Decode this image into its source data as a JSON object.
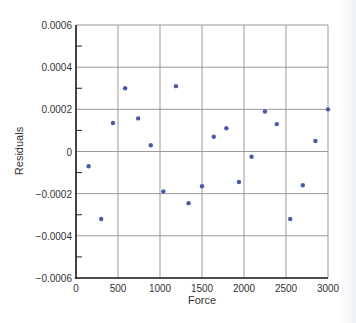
{
  "chart_data": {
    "type": "scatter",
    "title": "",
    "xlabel": "Force",
    "ylabel": "Residuals",
    "xlim": [
      0,
      3000
    ],
    "ylim": [
      -0.0006,
      0.0006
    ],
    "xticks": [
      "0",
      "500",
      "1000",
      "1500",
      "2000",
      "2500",
      "3000"
    ],
    "yticks": [
      "0.0006",
      "0.0004",
      "0.0002",
      "0",
      "−0.0002",
      "−0.0004",
      "−0.0006"
    ],
    "grid": true,
    "legend": null,
    "marker_color": "#4a5aa8",
    "series": [
      {
        "name": "Residuals",
        "x": [
          150,
          300,
          440,
          585,
          740,
          890,
          1040,
          1190,
          1340,
          1500,
          1640,
          1790,
          1940,
          2090,
          2250,
          2390,
          2550,
          2700,
          2850,
          3000
        ],
        "y": [
          -7e-05,
          -0.00032,
          0.000135,
          0.0003,
          0.000157,
          3e-05,
          -0.00019,
          0.00031,
          -0.000245,
          -0.000165,
          7e-05,
          0.00011,
          -0.000145,
          -2.5e-05,
          0.00019,
          0.00013,
          -0.00032,
          -0.00016,
          5e-05,
          0.0002
        ]
      }
    ]
  }
}
